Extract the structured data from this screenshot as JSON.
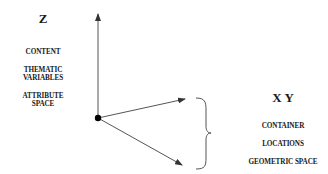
{
  "z_axis": {
    "title": "Z",
    "labels": [
      "CONTENT",
      "THEMATIC",
      "VARIABLES",
      "ATTRIBUTE",
      "SPACE"
    ]
  },
  "xy_axes": {
    "title": "X Y",
    "labels": [
      "CONTAINER",
      "LOCATIONS",
      "GEOMETRIC SPACE"
    ]
  },
  "colors": {
    "line": "#444444",
    "origin": "#000000",
    "text": "#1a1a1a"
  }
}
